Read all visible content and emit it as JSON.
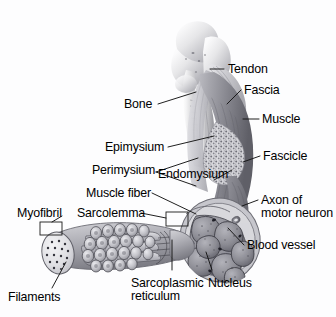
{
  "figure": {
    "style": "grayscale-airbrush-anatomical-illustration",
    "background_color": "#fdfdfe",
    "label_color": "#000000",
    "leader_line_color": "#1a1a1a"
  },
  "labels": [
    {
      "id": "tendon",
      "text": "Tendon",
      "x": 228,
      "y": 63
    },
    {
      "id": "fascia",
      "text": "Fascia",
      "x": 244,
      "y": 84
    },
    {
      "id": "bone",
      "text": "Bone",
      "x": 124,
      "y": 98
    },
    {
      "id": "muscle",
      "text": "Muscle",
      "x": 262,
      "y": 113
    },
    {
      "id": "epimysium",
      "text": "Epimysium",
      "x": 105,
      "y": 141
    },
    {
      "id": "fascicle",
      "text": "Fascicle",
      "x": 263,
      "y": 150
    },
    {
      "id": "perimysium",
      "text": "Perimysium",
      "x": 92,
      "y": 164
    },
    {
      "id": "endomysium",
      "text": "Endomysium",
      "x": 158,
      "y": 168
    },
    {
      "id": "muscle-fiber",
      "text": "Muscle fiber",
      "x": 86,
      "y": 187
    },
    {
      "id": "axon",
      "text": "Axon of\nmotor neuron",
      "x": 261,
      "y": 194
    },
    {
      "id": "myofibril",
      "text": "Myofibril",
      "x": 17,
      "y": 207
    },
    {
      "id": "sarcolemma",
      "text": "Sarcolemma",
      "x": 77,
      "y": 207
    },
    {
      "id": "blood-vessel",
      "text": "Blood vessel",
      "x": 247,
      "y": 239
    },
    {
      "id": "sarcoplasmic",
      "text": "Sarcoplasmic\nreticulum",
      "x": 131,
      "y": 277
    },
    {
      "id": "nucleus",
      "text": "Nucleus",
      "x": 208,
      "y": 277
    },
    {
      "id": "filaments",
      "text": "Filaments",
      "x": 8,
      "y": 291
    }
  ]
}
